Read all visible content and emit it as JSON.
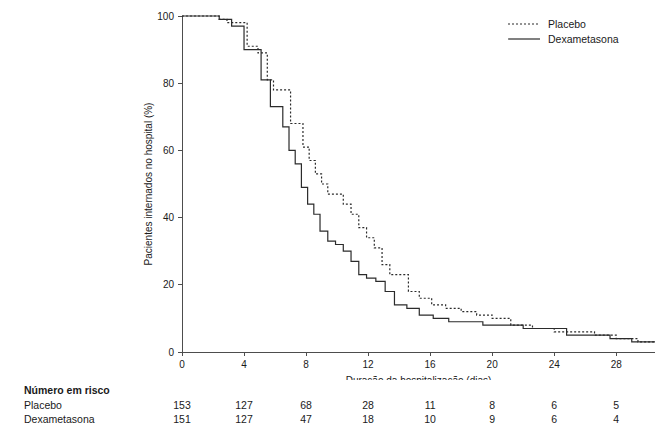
{
  "chart_data": {
    "type": "line",
    "title": "",
    "xlabel": "Duração da hospitalização (dias)",
    "ylabel": "Pacientes internados no hospital (%)",
    "xlim": [
      0,
      30.5
    ],
    "ylim": [
      0,
      100
    ],
    "xticks": [
      0,
      4,
      8,
      12,
      16,
      20,
      24,
      28
    ],
    "yticks": [
      0,
      20,
      40,
      60,
      80,
      100
    ],
    "xticklabels": [
      "0",
      "4",
      "8",
      "12",
      "16",
      "20",
      "24",
      "28"
    ],
    "yticklabels": [
      "0",
      "20",
      "40",
      "60",
      "80",
      "100"
    ],
    "grid": false,
    "legend_position": "top-right",
    "series": [
      {
        "name": "Placebo",
        "style": "dotted",
        "x": [
          0,
          0.6,
          1.2,
          1.8,
          2.4,
          2.9,
          3.2,
          3.5,
          3.8,
          4.2,
          4.5,
          4.9,
          5.2,
          5.5,
          5.9,
          6.2,
          6.6,
          7.0,
          7.4,
          7.8,
          8.2,
          8.6,
          9.0,
          9.4,
          9.9,
          10.4,
          10.9,
          11.4,
          11.9,
          12.4,
          12.9,
          13.4,
          13.9,
          14.6,
          15.3,
          16.1,
          17.0,
          18.0,
          19.0,
          20.0,
          21.2,
          22.6,
          24.0,
          25.4,
          26.6,
          28.0,
          29.4,
          30.5
        ],
        "y": [
          100,
          100,
          100,
          100,
          99,
          98,
          98,
          98,
          98,
          91,
          91,
          89,
          89,
          81,
          78,
          78,
          78,
          68,
          68,
          61,
          57,
          53,
          50,
          47,
          47,
          44,
          41,
          37,
          34,
          31,
          26,
          23,
          23,
          18,
          16,
          14,
          13,
          12,
          11,
          10,
          8,
          7,
          6,
          6,
          5,
          4,
          3,
          3
        ]
      },
      {
        "name": "Dexametasona",
        "style": "solid",
        "x": [
          0,
          0.6,
          1.2,
          1.8,
          2.4,
          2.9,
          3.2,
          3.6,
          4.0,
          4.4,
          4.8,
          5.1,
          5.4,
          5.7,
          6.1,
          6.5,
          6.9,
          7.3,
          7.7,
          8.1,
          8.5,
          8.9,
          9.4,
          9.9,
          10.4,
          10.9,
          11.4,
          11.9,
          12.5,
          13.1,
          13.7,
          14.5,
          15.3,
          16.2,
          17.2,
          18.2,
          19.4,
          20.6,
          22.0,
          23.4,
          24.8,
          26.2,
          27.6,
          29.0,
          30.5
        ],
        "y": [
          100,
          100,
          100,
          100,
          99,
          99,
          97,
          97,
          90,
          90,
          90,
          81,
          81,
          73,
          73,
          67,
          60,
          56,
          49,
          44,
          41,
          36,
          33,
          32,
          30,
          27,
          23,
          22,
          21,
          18,
          14,
          13,
          11,
          10,
          9,
          9,
          8,
          8,
          7,
          7,
          5,
          5,
          4,
          3,
          3
        ]
      }
    ]
  },
  "legend": {
    "items": [
      {
        "label": "Placebo",
        "style": "dotted"
      },
      {
        "label": "Dexametasona",
        "style": "solid"
      }
    ]
  },
  "risk_table": {
    "title": "Número em risco",
    "times": [
      0,
      4,
      8,
      12,
      16,
      20,
      24,
      28
    ],
    "rows": [
      {
        "label": "Placebo",
        "values": [
          "153",
          "127",
          "68",
          "28",
          "11",
          "8",
          "6",
          "5"
        ]
      },
      {
        "label": "Dexametasona",
        "values": [
          "151",
          "127",
          "47",
          "18",
          "10",
          "9",
          "6",
          "4"
        ]
      }
    ]
  }
}
